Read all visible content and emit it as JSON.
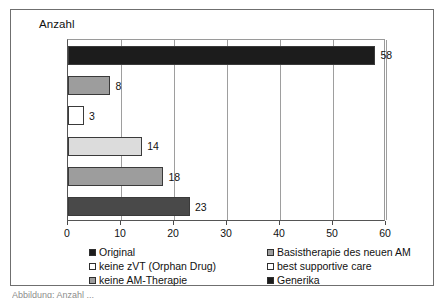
{
  "chart_data": {
    "type": "bar",
    "orientation": "horizontal",
    "title": "Anzahl",
    "xlabel": "",
    "ylabel": "",
    "xlim": [
      0,
      60
    ],
    "xticks": [
      0,
      10,
      20,
      30,
      40,
      50,
      60
    ],
    "grid": true,
    "legend_position": "bottom",
    "categories": [
      "Original",
      "Basistherapie des neuen AM",
      "keine zVT (Orphan Drug)",
      "best supportive care",
      "keine AM-Therapie",
      "Generika"
    ],
    "values": [
      58,
      8,
      3,
      14,
      18,
      23
    ],
    "data_labels": [
      "58",
      "8",
      "3",
      "14",
      "18",
      "23"
    ],
    "bars": [
      {
        "category": "Original",
        "value": 58,
        "label": "58",
        "color": "#1c1c1c"
      },
      {
        "category": "Basistherapie des neuen AM",
        "value": 8,
        "label": "8",
        "color": "#9d9d9d"
      },
      {
        "category": "keine zVT (Orphan Drug)",
        "value": 3,
        "label": "3",
        "color": "#ffffff"
      },
      {
        "category": "best supportive care",
        "value": 14,
        "label": "14",
        "color": "#dcdcdc"
      },
      {
        "category": "keine AM-Therapie",
        "value": 18,
        "label": "18",
        "color": "#9d9d9d"
      },
      {
        "category": "Generika",
        "value": 23,
        "label": "23",
        "color": "#494949"
      }
    ],
    "legend": [
      {
        "label": "Original",
        "color": "#1c1c1c",
        "column": "left",
        "row": 0
      },
      {
        "label": "keine zVT (Orphan Drug)",
        "color": "#ffffff",
        "column": "left",
        "row": 1
      },
      {
        "label": "keine AM-Therapie",
        "color": "#9d9d9d",
        "column": "left",
        "row": 2
      },
      {
        "label": "Basistherapie des neuen AM",
        "color": "#9d9d9d",
        "column": "right",
        "row": 0
      },
      {
        "label": "best supportive care",
        "color": "#ffffff",
        "column": "right",
        "row": 1
      },
      {
        "label": "Generika",
        "color": "#1c1c1c",
        "column": "right",
        "row": 2
      }
    ]
  },
  "caption": {
    "clipped_text": "Abbildung: Anzahl ..."
  }
}
